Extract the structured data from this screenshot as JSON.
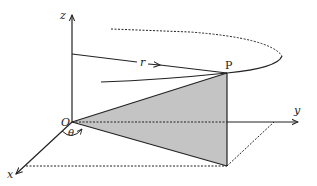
{
  "diagram": {
    "type": "3d-coordinate-geometry",
    "labels": {
      "z_axis": "z",
      "y_axis": "y",
      "x_axis": "x",
      "origin": "O",
      "point": "P",
      "radius": "r",
      "angle": "θ"
    },
    "colors": {
      "stroke": "#222222",
      "fill_triangle": "#c4c4c4",
      "background": "#ffffff"
    },
    "points": {
      "O": [
        72,
        122
      ],
      "P": [
        227,
        73
      ],
      "P_projection": [
        227,
        166
      ]
    }
  }
}
